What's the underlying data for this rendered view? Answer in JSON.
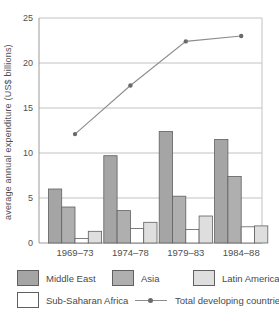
{
  "chart_data": {
    "type": "bar+line",
    "title": "",
    "xlabel": "",
    "ylabel": "average annual expenditure (US$ billions)",
    "ylim": [
      0,
      25
    ],
    "yticks": [
      0,
      5,
      10,
      15,
      20,
      25
    ],
    "grid": "horizontal",
    "legend_position": "bottom",
    "categories": [
      "1969–73",
      "1974–78",
      "1979–83",
      "1984–88"
    ],
    "series": [
      {
        "name": "Middle East",
        "type": "bar",
        "color": "#a5a5a5",
        "values": [
          6.0,
          9.7,
          12.4,
          11.5
        ]
      },
      {
        "name": "Asia",
        "type": "bar",
        "color": "#afafaf",
        "values": [
          4.0,
          3.6,
          5.2,
          7.4
        ]
      },
      {
        "name": "Sub-Saharan Africa",
        "type": "bar",
        "color": "#ffffff",
        "values": [
          0.5,
          1.6,
          1.5,
          1.8
        ]
      },
      {
        "name": "Latin America",
        "type": "bar",
        "color": "#dedede",
        "values": [
          1.3,
          2.3,
          3.0,
          1.9
        ]
      }
    ],
    "line_series": {
      "name": "Total developing countries",
      "color": "#8d8d8d",
      "marker_color": "#6a6a6a",
      "values": [
        12.1,
        17.5,
        22.4,
        23.0
      ]
    },
    "colors": {
      "axis": "#9b9b9b",
      "gridline": "#c2c2c2",
      "bar_border": "#606060",
      "text": "#4f4f4f"
    }
  }
}
